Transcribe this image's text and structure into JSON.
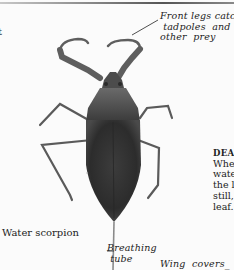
{
  "page": {
    "cut_text_left": "t",
    "caption": "Water scorpion",
    "labels": {
      "front_legs": "Front legs catch\n tadpoles  and\nother  prey",
      "breathing_tube": "Breathing\n tube",
      "wing_covers": "Wing  covers_"
    },
    "side_column": {
      "heading": "DEA",
      "lines": [
        "Whe",
        "wate",
        "the l",
        "still,",
        "leaf."
      ]
    }
  },
  "illustration": {
    "subject": "water-scorpion",
    "colors": {
      "body": "#3a3a3a",
      "legs": "#5a5a5a",
      "background": "#fbfbfb"
    }
  }
}
